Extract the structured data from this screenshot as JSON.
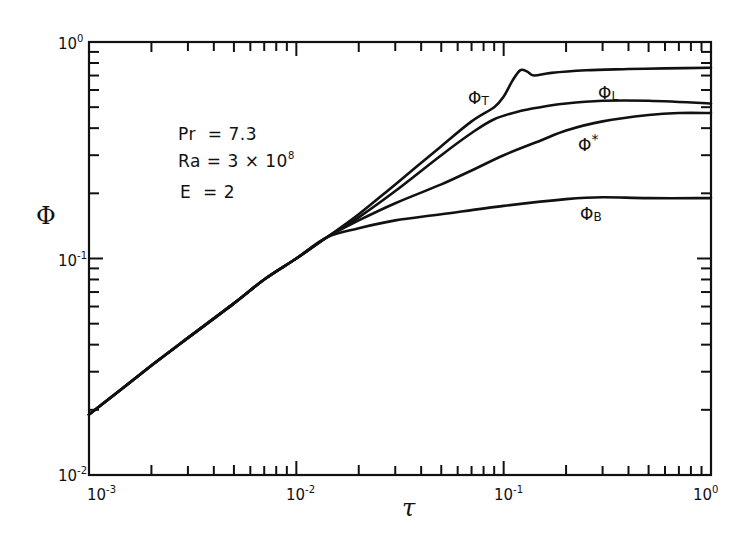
{
  "chart_data": {
    "type": "line",
    "title": "",
    "xlabel": "τ",
    "ylabel": "Φ",
    "xscale": "log",
    "yscale": "log",
    "xlim": [
      0.001,
      1
    ],
    "ylim": [
      0.01,
      1
    ],
    "grid": false,
    "x_ticks": [
      {
        "value": 0.001,
        "label_base": "10",
        "label_exp": "-3"
      },
      {
        "value": 0.01,
        "label_base": "10",
        "label_exp": "-2"
      },
      {
        "value": 0.1,
        "label_base": "10",
        "label_exp": "-1"
      },
      {
        "value": 1,
        "label_base": "10",
        "label_exp": "0"
      }
    ],
    "y_ticks": [
      {
        "value": 0.01,
        "label_base": "10",
        "label_exp": "-2"
      },
      {
        "value": 0.1,
        "label_base": "10",
        "label_exp": "-1"
      },
      {
        "value": 1,
        "label_base": "10",
        "label_exp": "0"
      }
    ],
    "annotations": [
      {
        "text": "Pr = 7.3",
        "name": "Pr",
        "value": "7.3"
      },
      {
        "text": "Ra = 3 × 10^8",
        "name": "Ra",
        "value": "3 × 10^8"
      },
      {
        "text": "E = 2",
        "name": "E",
        "value": "2"
      }
    ],
    "shared_early_curve": {
      "x": [
        0.001,
        0.002,
        0.003,
        0.005,
        0.007,
        0.01,
        0.014
      ],
      "values": [
        0.019,
        0.032,
        0.043,
        0.062,
        0.08,
        0.1,
        0.125
      ]
    },
    "series": [
      {
        "name": "Φ_T",
        "label_main": "Φ",
        "label_sub": "T",
        "x": [
          0.014,
          0.02,
          0.03,
          0.05,
          0.07,
          0.09,
          0.1,
          0.11,
          0.12,
          0.13,
          0.14,
          0.17,
          0.25,
          0.4,
          0.6,
          1.0
        ],
        "values": [
          0.125,
          0.16,
          0.22,
          0.33,
          0.43,
          0.5,
          0.56,
          0.66,
          0.74,
          0.73,
          0.7,
          0.72,
          0.74,
          0.75,
          0.755,
          0.76
        ]
      },
      {
        "name": "Φ_L",
        "label_main": "Φ",
        "label_sub": "L",
        "x": [
          0.014,
          0.02,
          0.03,
          0.05,
          0.07,
          0.09,
          0.12,
          0.15,
          0.2,
          0.3,
          0.5,
          1.0
        ],
        "values": [
          0.125,
          0.155,
          0.205,
          0.3,
          0.38,
          0.44,
          0.48,
          0.5,
          0.52,
          0.535,
          0.535,
          0.52
        ]
      },
      {
        "name": "Φ*",
        "label_main": "Φ",
        "label_sup": "*",
        "x": [
          0.014,
          0.02,
          0.03,
          0.05,
          0.07,
          0.1,
          0.15,
          0.2,
          0.3,
          0.5,
          0.7,
          1.0
        ],
        "values": [
          0.125,
          0.15,
          0.18,
          0.22,
          0.255,
          0.3,
          0.35,
          0.39,
          0.43,
          0.46,
          0.47,
          0.47
        ]
      },
      {
        "name": "Φ_B",
        "label_main": "Φ",
        "label_sub": "B",
        "x": [
          0.014,
          0.02,
          0.03,
          0.05,
          0.1,
          0.2,
          0.3,
          0.5,
          1.0
        ],
        "values": [
          0.125,
          0.138,
          0.15,
          0.16,
          0.175,
          0.188,
          0.192,
          0.19,
          0.19
        ]
      }
    ]
  },
  "axes": {
    "x_title": "τ",
    "y_title": "Φ"
  },
  "params": {
    "pr": {
      "lhs": "Pr",
      "eq": "=",
      "rhs": "7.3"
    },
    "ra": {
      "lhs": "Ra",
      "eq": "=",
      "rhs": "3 × 10",
      "exp": "8"
    },
    "e": {
      "lhs": "E",
      "eq": "=",
      "rhs": "2"
    }
  },
  "labels": {
    "phi": "Φ",
    "t": "T",
    "l": "L",
    "b": "B",
    "star": "*"
  },
  "ticks": {
    "base": "10",
    "x_m3": "-3",
    "x_m2": "-2",
    "x_m1": "-1",
    "x_0": "0",
    "y_m2": "-2",
    "y_m1": "-1",
    "y_0": "0"
  }
}
